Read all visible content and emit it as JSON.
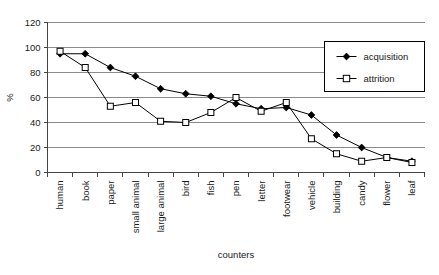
{
  "chart_data": {
    "type": "line",
    "title": "",
    "xlabel": "counters",
    "ylabel": "%",
    "ylim": [
      0,
      120
    ],
    "ytick_step": 20,
    "yticks": [
      "0",
      "20",
      "40",
      "60",
      "80",
      "100",
      "120"
    ],
    "grid": true,
    "legend_position": "upper-right",
    "categories": [
      "human",
      "book",
      "paper",
      "small animal",
      "large animal",
      "bird",
      "fish",
      "pen",
      "letter",
      "footwear",
      "vehicle",
      "building",
      "candy",
      "flower",
      "leaf"
    ],
    "series": [
      {
        "name": "acquisition",
        "marker": "filled-diamond",
        "values": [
          95,
          95,
          84,
          77,
          67,
          63,
          61,
          55,
          51,
          52,
          46,
          30,
          20,
          12,
          9
        ]
      },
      {
        "name": "attrition",
        "marker": "open-square",
        "values": [
          97,
          84,
          53,
          56,
          41,
          40,
          48,
          60,
          49,
          56,
          27,
          15,
          9,
          12,
          8
        ]
      }
    ]
  },
  "legend": {
    "entries": [
      {
        "label": "acquisition"
      },
      {
        "label": "attrition"
      }
    ]
  }
}
